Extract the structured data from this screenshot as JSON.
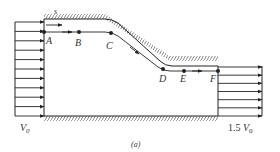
{
  "figure": {
    "caption": "(a)",
    "coordinate_label": "s",
    "points": [
      {
        "id": "A",
        "label": "A"
      },
      {
        "id": "B",
        "label": "B"
      },
      {
        "id": "C",
        "label": "C"
      },
      {
        "id": "D",
        "label": "D"
      },
      {
        "id": "E",
        "label": "E"
      },
      {
        "id": "F",
        "label": "F"
      }
    ],
    "inlet": {
      "velocity_label": "V",
      "velocity_subscript": "0",
      "arrow_count": 11
    },
    "outlet": {
      "velocity_prefix": "1.5 ",
      "velocity_label": "V",
      "velocity_subscript": "0",
      "arrow_count": 7
    }
  },
  "colors": {
    "line": "#222222",
    "hatch": "#555555",
    "text": "#333333",
    "background": "#ffffff"
  }
}
